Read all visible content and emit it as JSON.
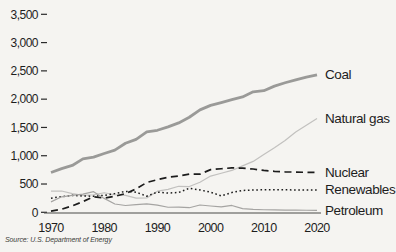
{
  "figure": {
    "source": "Source: U.S. Department of Energy",
    "background": "#f5f4f1",
    "axis_color": "#4a4a48",
    "tick_color": "#2a2a2a",
    "text_color": "#1d1d1d"
  },
  "chart_data": {
    "type": "line",
    "title": "",
    "xlabel": "",
    "ylabel": "",
    "xlim": [
      1970,
      2020
    ],
    "ylim": [
      0,
      3500
    ],
    "grid": false,
    "legend_position": "right-of-line-ends",
    "source": "Source: U.S. Department of Energy",
    "x": [
      1970,
      1972,
      1974,
      1976,
      1978,
      1980,
      1982,
      1984,
      1986,
      1988,
      1990,
      1992,
      1994,
      1996,
      1998,
      2000,
      2002,
      2004,
      2006,
      2008,
      2010,
      2012,
      2014,
      2016,
      2018,
      2020
    ],
    "x_ticks": [
      {
        "value": 1970,
        "label": "1970"
      },
      {
        "value": 1980,
        "label": "1980"
      },
      {
        "value": 1990,
        "label": "1990"
      },
      {
        "value": 2000,
        "label": "2000"
      },
      {
        "value": 2010,
        "label": "2010"
      },
      {
        "value": 2020,
        "label": "2020"
      }
    ],
    "y_ticks": [
      {
        "value": 0,
        "label": "0"
      },
      {
        "value": 500,
        "label": "500"
      },
      {
        "value": 1000,
        "label": "1,000"
      },
      {
        "value": 1500,
        "label": "1,500"
      },
      {
        "value": 2000,
        "label": "2,000"
      },
      {
        "value": 2500,
        "label": "2,500"
      },
      {
        "value": 3000,
        "label": "3,000"
      },
      {
        "value": 3500,
        "label": "3,500"
      }
    ],
    "series": [
      {
        "name": "Coal",
        "color": "#9a9a98",
        "line_style": "solid",
        "line_width": 2.8,
        "values": [
          704,
          771,
          828,
          944,
          976,
          1040,
          1100,
          1220,
          1290,
          1420,
          1450,
          1510,
          1580,
          1680,
          1810,
          1890,
          1940,
          1990,
          2040,
          2130,
          2150,
          2230,
          2290,
          2340,
          2390,
          2430
        ]
      },
      {
        "name": "Natural gas",
        "color": "#c2c1bf",
        "line_style": "solid",
        "line_width": 1.2,
        "values": [
          373,
          376,
          330,
          300,
          310,
          345,
          310,
          300,
          250,
          255,
          373,
          404,
          460,
          455,
          530,
          640,
          690,
          740,
          820,
          900,
          1020,
          1140,
          1270,
          1420,
          1540,
          1660
        ]
      },
      {
        "name": "Nuclear",
        "color": "#1c1c1c",
        "line_style": "dashed",
        "line_width": 1.7,
        "values": [
          22,
          54,
          114,
          190,
          276,
          250,
          283,
          330,
          414,
          527,
          577,
          619,
          640,
          675,
          674,
          754,
          770,
          785,
          780,
          765,
          740,
          725,
          715,
          710,
          707,
          705
        ]
      },
      {
        "name": "Renewables",
        "color": "#1c1c1c",
        "line_style": "dotted",
        "line_width": 1.5,
        "values": [
          250,
          276,
          300,
          287,
          285,
          300,
          330,
          370,
          355,
          285,
          357,
          340,
          350,
          425,
          395,
          356,
          290,
          350,
          385,
          395,
          398,
          398,
          397,
          396,
          396,
          395
        ]
      },
      {
        "name": "Petroleum",
        "color": "#a5a4a2",
        "line_style": "solid",
        "line_width": 1.2,
        "values": [
          184,
          274,
          300,
          320,
          365,
          246,
          147,
          120,
          137,
          149,
          127,
          89,
          91,
          81,
          129,
          111,
          95,
          121,
          64,
          50,
          45,
          42,
          40,
          38,
          36,
          35
        ]
      }
    ]
  }
}
